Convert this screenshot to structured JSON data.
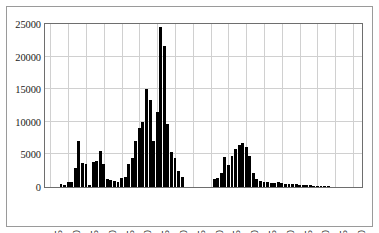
{
  "chart_data": {
    "type": "bar",
    "title": "",
    "subtitle": "",
    "xlabel": "",
    "ylabel": "",
    "xlim": [
      1903.5,
      1992.5
    ],
    "ylim": [
      0,
      25000
    ],
    "grid": true,
    "legend": null,
    "bar_color": "#000000",
    "yticks": [
      0,
      5000,
      10000,
      15000,
      20000,
      25000
    ],
    "ytick_labels": [
      "0",
      "5000",
      "10000",
      "15000",
      "20000",
      "25000"
    ],
    "xticks": [
      1905,
      1910,
      1915,
      1920,
      1925,
      1930,
      1935,
      1940,
      1945,
      1950,
      1955,
      1960,
      1965,
      1970,
      1975,
      1980,
      1985,
      1990
    ],
    "xtick_labels": [
      "1905",
      "1910",
      "1915",
      "1920",
      "1925",
      "1930",
      "1935",
      "1940",
      "1945",
      "1950",
      "1955",
      "1960",
      "1965",
      "1970",
      "1975",
      "1980",
      "1985",
      "1990"
    ],
    "x": [
      1908,
      1909,
      1910,
      1911,
      1912,
      1913,
      1914,
      1915,
      1916,
      1917,
      1918,
      1919,
      1920,
      1921,
      1922,
      1923,
      1924,
      1925,
      1926,
      1927,
      1928,
      1929,
      1930,
      1931,
      1932,
      1933,
      1934,
      1935,
      1936,
      1937,
      1938,
      1939,
      1940,
      1941,
      1942,
      1951,
      1952,
      1953,
      1954,
      1955,
      1956,
      1957,
      1958,
      1959,
      1960,
      1961,
      1962,
      1963,
      1964,
      1965,
      1966,
      1967,
      1968,
      1969,
      1970,
      1971,
      1972,
      1973,
      1974,
      1975,
      1976,
      1977,
      1978,
      1979,
      1980,
      1981,
      1982,
      1983
    ],
    "values": [
      500,
      300,
      700,
      700,
      2900,
      7000,
      3700,
      3600,
      300,
      3800,
      4000,
      5550,
      3500,
      1200,
      1000,
      900,
      800,
      1400,
      1600,
      3600,
      4400,
      7000,
      9000,
      10000,
      15000,
      13300,
      7000,
      11500,
      24500,
      21700,
      9700,
      5400,
      4400,
      2400,
      1500,
      1300,
      1400,
      2200,
      4600,
      3300,
      4700,
      5900,
      6400,
      6800,
      6100,
      4700,
      2200,
      1300,
      900,
      800,
      700,
      650,
      600,
      700,
      550,
      500,
      480,
      450,
      400,
      380,
      350,
      300,
      250,
      220,
      180,
      120,
      80,
      40
    ]
  },
  "series_label": "Annual counts"
}
